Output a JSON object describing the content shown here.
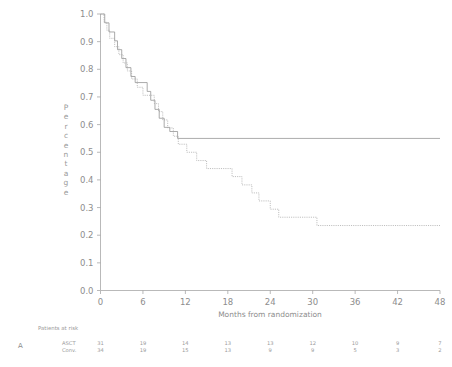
{
  "figure": {
    "panel_label": "A"
  },
  "chart_data": {
    "type": "line",
    "title": "",
    "xlabel": "Months from randomization",
    "ylabel": "Percentage",
    "xlim": [
      0,
      48
    ],
    "ylim": [
      0.0,
      1.0
    ],
    "xticks": [
      0,
      6,
      12,
      18,
      24,
      30,
      36,
      42,
      48
    ],
    "xtick_labels": [
      "0",
      "6",
      "12",
      "18",
      "24",
      "30",
      "36",
      "42",
      "48"
    ],
    "yticks": [
      0.0,
      0.1,
      0.2,
      0.3,
      0.4,
      0.5,
      0.6,
      0.7,
      0.8,
      0.9,
      1.0
    ],
    "ytick_labels": [
      "0.0",
      "0.1",
      "0.2",
      "0.3",
      "0.4",
      "0.5",
      "0.6",
      "0.7",
      "0.8",
      "0.9",
      "1.0"
    ],
    "grid": false,
    "legend": "none",
    "series": [
      {
        "name": "ASCT",
        "style": "solid",
        "color": "#8f8f8f",
        "points": [
          [
            0.0,
            1.0
          ],
          [
            0.6,
            1.0
          ],
          [
            0.6,
            0.968
          ],
          [
            1.2,
            0.968
          ],
          [
            1.2,
            0.935
          ],
          [
            2.0,
            0.935
          ],
          [
            2.0,
            0.903
          ],
          [
            2.4,
            0.903
          ],
          [
            2.4,
            0.871
          ],
          [
            3.0,
            0.871
          ],
          [
            3.0,
            0.839
          ],
          [
            3.6,
            0.839
          ],
          [
            3.6,
            0.806
          ],
          [
            4.3,
            0.806
          ],
          [
            4.3,
            0.774
          ],
          [
            4.9,
            0.774
          ],
          [
            4.9,
            0.752
          ],
          [
            6.6,
            0.752
          ],
          [
            6.6,
            0.72
          ],
          [
            7.1,
            0.72
          ],
          [
            7.1,
            0.688
          ],
          [
            7.7,
            0.688
          ],
          [
            7.7,
            0.655
          ],
          [
            8.3,
            0.655
          ],
          [
            8.3,
            0.623
          ],
          [
            9.0,
            0.623
          ],
          [
            9.0,
            0.59
          ],
          [
            9.8,
            0.59
          ],
          [
            9.8,
            0.575
          ],
          [
            10.9,
            0.575
          ],
          [
            10.9,
            0.55
          ],
          [
            48.0,
            0.55
          ]
        ]
      },
      {
        "name": "Conv.",
        "style": "dotted",
        "color": "#a8a8a8",
        "points": [
          [
            0.0,
            1.0
          ],
          [
            0.5,
            1.0
          ],
          [
            0.5,
            0.97
          ],
          [
            0.9,
            0.97
          ],
          [
            0.9,
            0.941
          ],
          [
            1.3,
            0.941
          ],
          [
            1.3,
            0.912
          ],
          [
            2.0,
            0.912
          ],
          [
            2.0,
            0.882
          ],
          [
            2.6,
            0.882
          ],
          [
            2.6,
            0.853
          ],
          [
            3.2,
            0.853
          ],
          [
            3.2,
            0.823
          ],
          [
            3.8,
            0.823
          ],
          [
            3.8,
            0.794
          ],
          [
            4.4,
            0.794
          ],
          [
            4.4,
            0.765
          ],
          [
            5.2,
            0.765
          ],
          [
            5.2,
            0.735
          ],
          [
            6.0,
            0.735
          ],
          [
            6.0,
            0.706
          ],
          [
            7.6,
            0.706
          ],
          [
            7.6,
            0.676
          ],
          [
            8.2,
            0.676
          ],
          [
            8.2,
            0.647
          ],
          [
            8.8,
            0.647
          ],
          [
            8.8,
            0.617
          ],
          [
            9.5,
            0.617
          ],
          [
            9.5,
            0.588
          ],
          [
            10.3,
            0.588
          ],
          [
            10.3,
            0.558
          ],
          [
            11.0,
            0.558
          ],
          [
            11.0,
            0.529
          ],
          [
            12.2,
            0.529
          ],
          [
            12.2,
            0.5
          ],
          [
            13.6,
            0.5
          ],
          [
            13.6,
            0.47
          ],
          [
            15.0,
            0.47
          ],
          [
            15.0,
            0.441
          ],
          [
            18.6,
            0.441
          ],
          [
            18.6,
            0.412
          ],
          [
            20.0,
            0.412
          ],
          [
            20.0,
            0.382
          ],
          [
            21.4,
            0.382
          ],
          [
            21.4,
            0.353
          ],
          [
            22.4,
            0.353
          ],
          [
            22.4,
            0.324
          ],
          [
            24.0,
            0.324
          ],
          [
            24.0,
            0.294
          ],
          [
            25.2,
            0.294
          ],
          [
            25.2,
            0.265
          ],
          [
            30.6,
            0.265
          ],
          [
            30.6,
            0.235
          ],
          [
            48.0,
            0.235
          ]
        ]
      }
    ]
  },
  "risk_table": {
    "heading": "Patients at risk",
    "row_labels": [
      "ASCT",
      "Conv."
    ],
    "time_points": [
      0,
      6,
      12,
      18,
      24,
      30,
      36,
      42,
      48
    ],
    "rows": [
      {
        "label": "ASCT",
        "values": [
          "31",
          "19",
          "14",
          "13",
          "13",
          "12",
          "10",
          "9",
          "7"
        ]
      },
      {
        "label": "Conv.",
        "values": [
          "34",
          "19",
          "15",
          "13",
          "9",
          "9",
          "5",
          "3",
          "2"
        ]
      }
    ]
  }
}
